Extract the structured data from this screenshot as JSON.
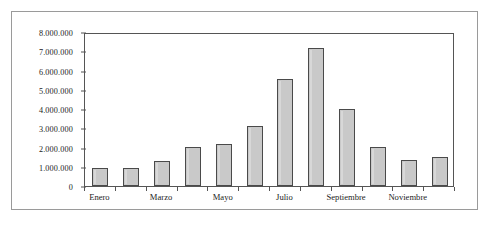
{
  "chart_data": {
    "type": "bar",
    "title": "",
    "xlabel": "",
    "ylabel": "",
    "ylim": [
      0,
      8000000
    ],
    "grid": false,
    "legend": "none",
    "categories": [
      "Enero",
      "Febrero",
      "Marzo",
      "Abril",
      "Mayo",
      "Junio",
      "Julio",
      "Agosto",
      "Septiembre",
      "Octubre",
      "Noviembre",
      "Diciembre"
    ],
    "values": [
      950000,
      950000,
      1300000,
      2050000,
      2200000,
      3100000,
      5550000,
      7150000,
      4000000,
      2050000,
      1350000,
      1500000
    ],
    "y_tick_values": [
      0,
      1000000,
      2000000,
      3000000,
      4000000,
      5000000,
      6000000,
      7000000,
      8000000
    ],
    "y_tick_labels": [
      "0",
      "1.000.000",
      "2.000.000",
      "3.000.000",
      "4.000.000",
      "5.000.000",
      "6.000.000",
      "7.000.000",
      "8.000.000"
    ],
    "x_tick_labels_shown": [
      "Enero",
      "Marzo",
      "Mayo",
      "Julio",
      "Septiembre",
      "Noviembre"
    ],
    "x_tick_label_indices": [
      0,
      2,
      4,
      6,
      8,
      10
    ],
    "colors": {
      "bar_fill": "#c9c9c9",
      "bar_border": "#4a4a4a",
      "axis": "#555555",
      "text": "#1c1c1c",
      "frame": "#9a9a9a",
      "background": "#ffffff"
    }
  }
}
